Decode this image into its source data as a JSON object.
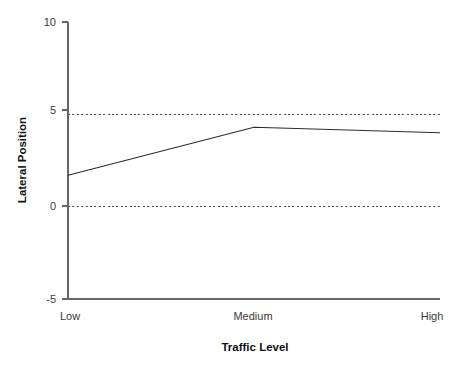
{
  "chart_data": {
    "type": "line",
    "title": "",
    "subtitle": "",
    "xlabel": "Traffic Level",
    "ylabel": "Lateral Position",
    "categories": [
      "Low",
      "Medium",
      "High"
    ],
    "values": [
      1.7,
      4.3,
      4.0
    ],
    "series": [
      {
        "name": "Lateral Position",
        "values": [
          1.7,
          4.3,
          4.0
        ],
        "color": "#2b2b2b"
      }
    ],
    "ylim": [
      -5,
      10
    ],
    "yticks": [
      10,
      5,
      0,
      -5
    ],
    "ytick_labels": [
      "10",
      "5",
      "0",
      "-5"
    ],
    "xticks": [
      "Low",
      "Medium",
      "High"
    ],
    "gridlines": {
      "y_values": [
        5,
        0
      ],
      "style": "dashed",
      "color": "#4a4a4a"
    },
    "grid": true,
    "legend": false,
    "legend_position": "none",
    "annotations": []
  },
  "axis": {
    "y_tick_0": "10",
    "y_tick_1": "5",
    "y_tick_2": "0",
    "y_tick_3": "-5",
    "x_cat_0": "Low",
    "x_cat_1": "Medium",
    "x_cat_2": "High",
    "y_title": "Lateral Position",
    "x_title": "Traffic Level"
  }
}
